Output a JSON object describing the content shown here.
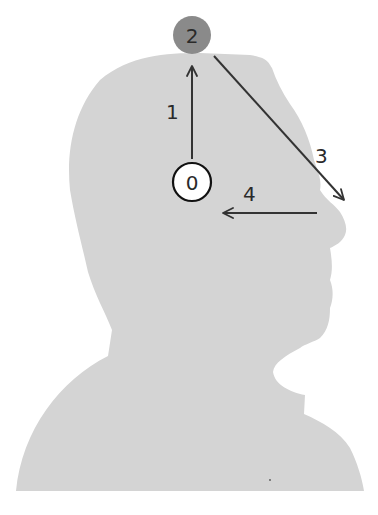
{
  "diagram": {
    "colors": {
      "background": "#ffffff",
      "silhouette": "#d4d4d4",
      "arrow": "#333333",
      "start_circle_fill": "#ffffff",
      "start_circle_stroke": "#111111",
      "top_circle_fill": "#8a8a8a"
    },
    "nodes": [
      {
        "id": "start",
        "label": "0",
        "shape": "circle",
        "style": "white-outlined"
      },
      {
        "id": "top",
        "label": "2",
        "shape": "circle",
        "style": "gray-filled"
      }
    ],
    "arrows": [
      {
        "label": "1",
        "from": "start circle",
        "to": "top of head",
        "direction": "up"
      },
      {
        "label": "3",
        "from": "top of head",
        "to": "nose tip",
        "direction": "down-right"
      },
      {
        "label": "4",
        "from": "nose tip",
        "to": "near start circle",
        "direction": "left"
      }
    ]
  }
}
